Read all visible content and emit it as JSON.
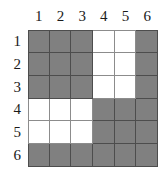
{
  "figure": {
    "kind": "shaded-grid-matrix",
    "rows": 6,
    "columns": 6,
    "filled_color": "#808080",
    "empty_color": "#ffffff",
    "gridline_color": "#8c8c8c",
    "filled_gridline_color": "#4d4d4d"
  },
  "column_headers": [
    "1",
    "2",
    "3",
    "4",
    "5",
    "6"
  ],
  "row_headers": [
    "1",
    "2",
    "3",
    "4",
    "5",
    "6"
  ],
  "chart_data": {
    "type": "heatmap",
    "title": "",
    "xlabel": "",
    "ylabel": "",
    "categories": [
      "1",
      "2",
      "3",
      "4",
      "5",
      "6"
    ],
    "row_categories": [
      "1",
      "2",
      "3",
      "4",
      "5",
      "6"
    ],
    "legend": [],
    "grid": true,
    "value_meaning": {
      "1": "shaded",
      "0": "white"
    },
    "values": [
      [
        1,
        1,
        1,
        0,
        0,
        1
      ],
      [
        1,
        1,
        1,
        0,
        0,
        1
      ],
      [
        1,
        1,
        1,
        0,
        0,
        1
      ],
      [
        0,
        0,
        0,
        1,
        1,
        1
      ],
      [
        0,
        0,
        0,
        1,
        1,
        1
      ],
      [
        1,
        1,
        1,
        1,
        1,
        1
      ]
    ]
  }
}
